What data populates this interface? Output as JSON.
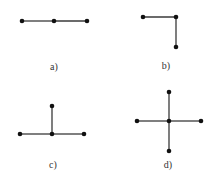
{
  "figures": [
    {
      "id": "a",
      "label": "a)",
      "label_pos": [
        54,
        66
      ],
      "nodes": [
        [
          22,
          21
        ],
        [
          54,
          21
        ],
        [
          87,
          21
        ]
      ],
      "edges": [
        [
          0,
          1
        ],
        [
          1,
          2
        ]
      ]
    },
    {
      "id": "b",
      "label": "b)",
      "label_pos": [
        166,
        65
      ],
      "nodes": [
        [
          143,
          17
        ],
        [
          176,
          17
        ],
        [
          176,
          47
        ]
      ],
      "edges": [
        [
          0,
          1
        ],
        [
          1,
          2
        ]
      ]
    },
    {
      "id": "c",
      "label": "c)",
      "label_pos": [
        53,
        164
      ],
      "nodes": [
        [
          52,
          106
        ],
        [
          20,
          134
        ],
        [
          52,
          134
        ],
        [
          84,
          134
        ]
      ],
      "edges": [
        [
          1,
          2
        ],
        [
          2,
          3
        ],
        [
          0,
          2
        ]
      ]
    },
    {
      "id": "d",
      "label": "d)",
      "label_pos": [
        168,
        164
      ],
      "nodes": [
        [
          169,
          92
        ],
        [
          137,
          121
        ],
        [
          169,
          121
        ],
        [
          201,
          121
        ],
        [
          169,
          151
        ]
      ],
      "edges": [
        [
          1,
          2
        ],
        [
          2,
          3
        ],
        [
          0,
          2
        ],
        [
          2,
          4
        ]
      ]
    }
  ],
  "colors": {
    "edge": "#3a3a3a",
    "node": "#111111",
    "label": "#333333"
  }
}
